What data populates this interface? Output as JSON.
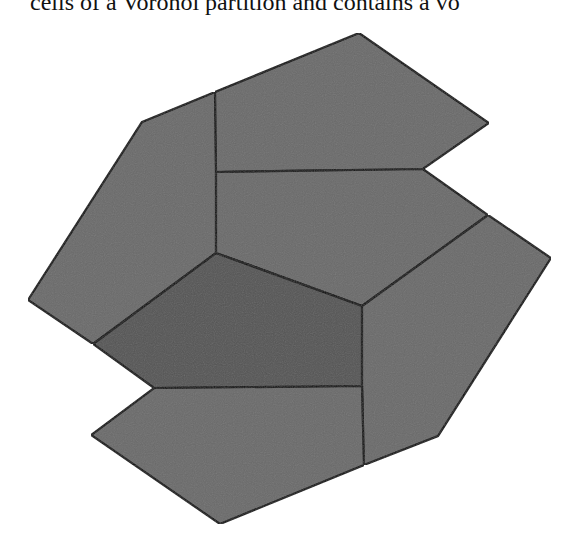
{
  "header": {
    "clipped_text": "cells of a Voronoi partition and contains a vo"
  },
  "figure": {
    "colors": {
      "cell_fill": "#6a6a6a",
      "highlight_fill": "#555555",
      "edge_stroke": "#000000",
      "background": "#ffffff"
    },
    "cells": [
      {
        "id": "top-center",
        "points": "215,92 359,33 489,123 423,169 216,172"
      },
      {
        "id": "top-left",
        "points": "142,122 215,92 216,172 216,253 93,344 28,300"
      },
      {
        "id": "middle-center",
        "points": "216,172 423,169 488,215 362,306 216,253"
      },
      {
        "id": "right",
        "points": "488,215 551,258 438,436 364,465 362,386 362,306"
      },
      {
        "id": "center-highlighted",
        "points": "216,253 362,306 362,386 154,388 93,344",
        "highlighted": true
      },
      {
        "id": "bottom",
        "points": "154,388 362,386 364,465 220,524 91,435"
      }
    ]
  }
}
